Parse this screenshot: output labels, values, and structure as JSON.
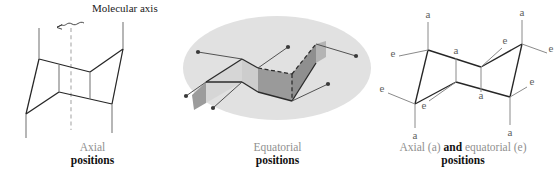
{
  "figure": {
    "title_present": false,
    "background_color": "#ffffff"
  },
  "annotations": {
    "molecular_axis_label": "Molecular axis"
  },
  "panels": [
    {
      "id": "axial",
      "caption_line1": "Axial",
      "caption_line2": "positions",
      "description": "Cyclohexane chair with six vertical axial bonds and a dashed molecular axis"
    },
    {
      "id": "equatorial",
      "caption_line1": "Equatorial",
      "caption_line2": "positions",
      "description": "Cyclohexane chair inside a grey ellipse with shaded planes and six equatorial bonds ending in dots"
    },
    {
      "id": "both",
      "caption_line1_pre": "Axial (a) ",
      "caption_line1_and": "and",
      "caption_line1_post": " equatorial (e)",
      "caption_line2": "positions",
      "description": "Cyclohexane chair labelled with a and e at every bond"
    }
  ],
  "bond_labels": {
    "axial": "a",
    "equatorial": "e"
  },
  "right_panel_labels": [
    {
      "text": "a",
      "x": 33,
      "y": 11
    },
    {
      "text": "e",
      "x": 10,
      "y": 52
    },
    {
      "text": "a",
      "x": 50,
      "y": 60
    },
    {
      "text": "e",
      "x": 0,
      "y": 86
    },
    {
      "text": "e",
      "x": 40,
      "y": 101
    },
    {
      "text": "a",
      "x": 32,
      "y": 128
    },
    {
      "text": "e",
      "x": 120,
      "y": 42
    },
    {
      "text": "a",
      "x": 144,
      "y": 12
    },
    {
      "text": "e",
      "x": 166,
      "y": 50
    },
    {
      "text": "a",
      "x": 105,
      "y": 78
    },
    {
      "text": "e",
      "x": 139,
      "y": 88
    },
    {
      "text": "a",
      "x": 112,
      "y": 128
    }
  ],
  "colors": {
    "line": "#262626",
    "thin_line": "#7a7a7a",
    "dashed_axis": "#a9a9a9",
    "ellipse_fill": "#e0e0e0",
    "plane_light": "#d2d2d2",
    "plane_dark": "#9a9a9a",
    "caption_grey": "#8f8f8f",
    "caption_black": "#111111",
    "label_grey": "#6e6e6e"
  }
}
